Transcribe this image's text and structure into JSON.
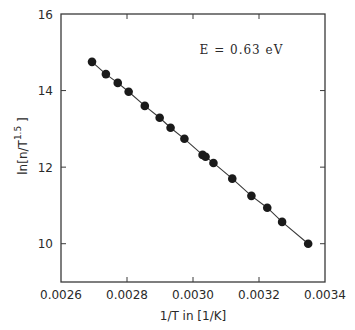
{
  "chart_data": {
    "type": "scatter",
    "title": "",
    "xlabel": "1/T in [1/K]",
    "ylabel": "ln[n/T^1.5]",
    "ylabel_parts": {
      "prefix": "ln[n/T",
      "superscript": "1.5",
      "suffix": "]"
    },
    "xlim": [
      0.0026,
      0.0034
    ],
    "ylim": [
      9,
      16
    ],
    "xticks": [
      0.0026,
      0.0028,
      0.003,
      0.0032,
      0.0034
    ],
    "xtick_labels": [
      "0.0026",
      "0.0028",
      "0.0030",
      "0.0032",
      "0.0034"
    ],
    "yticks": [
      10,
      12,
      14,
      16
    ],
    "ytick_labels": [
      "10",
      "12",
      "14",
      "16"
    ],
    "grid": false,
    "legend": null,
    "annotations": [
      {
        "text": "E = 0.63 eV",
        "x": 0.00302,
        "y": 14.95
      }
    ],
    "series": [
      {
        "name": "data",
        "marker": "filled-circle",
        "line": "connected",
        "x": [
          0.002694,
          0.002736,
          0.002772,
          0.002805,
          0.002854,
          0.002899,
          0.002932,
          0.002974,
          0.003029,
          0.003038,
          0.003062,
          0.003119,
          0.003177,
          0.003225,
          0.00327,
          0.003349
        ],
        "y": [
          14.75,
          14.43,
          14.2,
          13.97,
          13.6,
          13.29,
          13.03,
          12.74,
          12.32,
          12.27,
          12.11,
          11.7,
          11.25,
          10.94,
          10.57,
          10.0
        ]
      }
    ],
    "colors": {
      "axis": "#3a3a3a",
      "marker": "#1a1a1a",
      "line": "#3a3a3a"
    }
  }
}
